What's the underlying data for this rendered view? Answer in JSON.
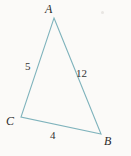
{
  "figure": {
    "type": "triangle-diagram",
    "background_color": "#fbfaf8",
    "stroke_color": "#7fb3bc",
    "label_color": "#2b2b2b",
    "vertices": [
      {
        "name": "A",
        "label": "A",
        "x": 54,
        "y": 18
      },
      {
        "name": "B",
        "label": "B",
        "x": 101,
        "y": 134
      },
      {
        "name": "C",
        "label": "C",
        "x": 21,
        "y": 117
      }
    ],
    "sides": [
      {
        "name": "AC",
        "label": "5",
        "from": "A",
        "to": "C"
      },
      {
        "name": "AB",
        "label": "12",
        "from": "A",
        "to": "B"
      },
      {
        "name": "CB",
        "label": "4",
        "from": "C",
        "to": "B"
      }
    ]
  },
  "chart_data": {
    "type": "diagram",
    "title": "",
    "shape": "triangle",
    "vertex_labels": [
      "A",
      "B",
      "C"
    ],
    "side_labels": [
      "5",
      "12",
      "4"
    ],
    "side_lengths": {
      "AC": 5,
      "AB": 12,
      "CB": 4
    },
    "points": {
      "A": [
        54,
        18
      ],
      "B": [
        101,
        134
      ],
      "C": [
        21,
        117
      ]
    }
  }
}
